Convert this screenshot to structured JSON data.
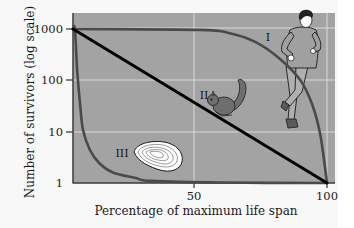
{
  "chart_data": {
    "type": "line",
    "title": "",
    "xlabel": "Percentage of maximum life span",
    "ylabel": "Number of survivors (log scale)",
    "x_ticks": [
      50,
      100
    ],
    "x_tick_labels": [
      "50",
      "100"
    ],
    "y_scale": "log",
    "y_ticks": [
      1000,
      100,
      10,
      1
    ],
    "y_tick_labels": [
      "1000",
      "100",
      "10",
      "1"
    ],
    "xlim": [
      0,
      100
    ],
    "ylim": [
      1,
      1000
    ],
    "grid": true,
    "legend": "none (curves labeled inline)",
    "series": [
      {
        "name": "I",
        "annotation": "human (runner)",
        "x": [
          0,
          52,
          63.5,
          73,
          82,
          90,
          94.5,
          97.5,
          100
        ],
        "values": [
          1000,
          960,
          830,
          560,
          270,
          100,
          33,
          8.5,
          1
        ]
      },
      {
        "name": "II",
        "annotation": "squirrel",
        "x": [
          0,
          100
        ],
        "values": [
          1000,
          1
        ]
      },
      {
        "name": "III",
        "annotation": "oyster",
        "x": [
          0,
          0.8,
          1.7,
          2.9,
          4.1,
          7,
          11,
          16.5,
          26,
          32,
          60,
          100
        ],
        "values": [
          1000,
          1000,
          160,
          36,
          11,
          4.4,
          2.4,
          1.6,
          1.25,
          1.1,
          1.02,
          1
        ]
      }
    ]
  },
  "labels": {
    "curve_I": "I",
    "curve_II": "II",
    "curve_III": "III"
  },
  "colors": {
    "plot_bg": "#a3a3a3",
    "grid": "#d9d9d9",
    "curve_I": "#4a4a4a",
    "curve_II": "#000000",
    "curve_III": "#4a4a4a"
  }
}
